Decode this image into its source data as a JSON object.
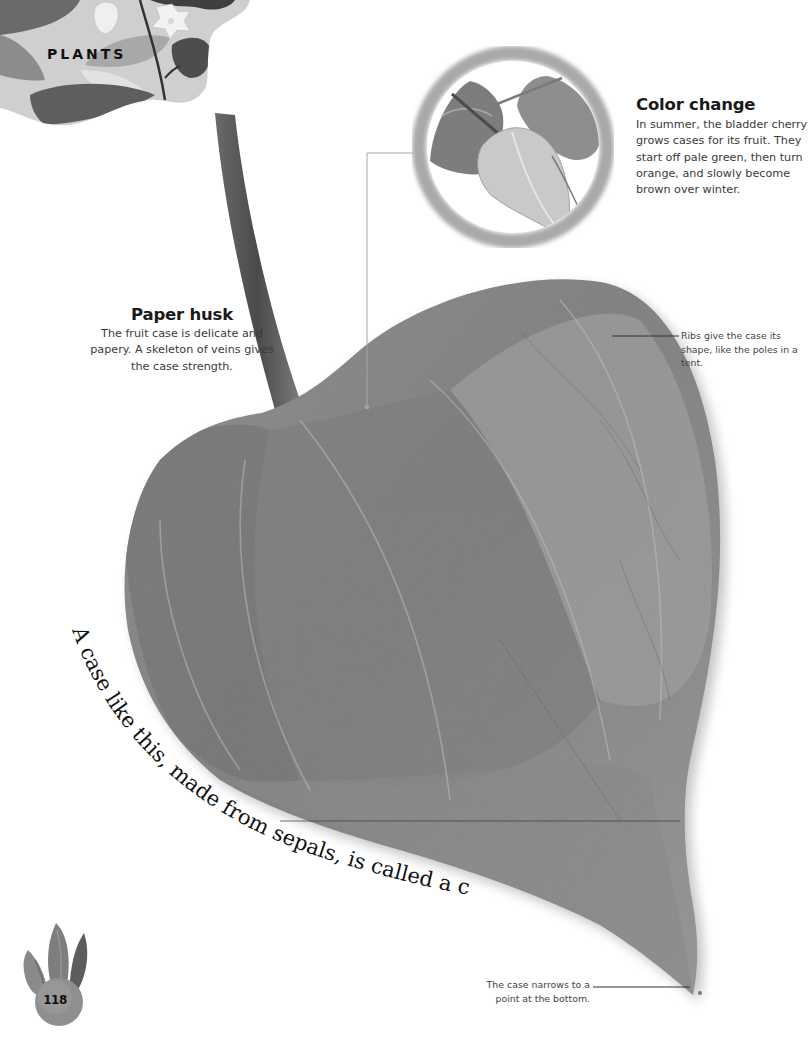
{
  "page": {
    "section_label": "PLANTS",
    "page_number": "118"
  },
  "color_change": {
    "heading": "Color change",
    "body": "In summer, the bladder cherry grows cases for its fruit. They start off pale green, then turn orange, and slowly become brown over winter."
  },
  "paper_husk": {
    "heading": "Paper husk",
    "body": "The fruit case is delicate and papery. A skeleton of veins gives the case strength."
  },
  "annotations": {
    "ribs": "Ribs give the case its shape, like the poles in a tent.",
    "narrow_point": "The case narrows to a point at the bottom."
  },
  "calyx_caption": "A case like this, made from sepals, is called a calyx.",
  "images": {
    "main": "bladder-cherry-fruit-case",
    "inset": "three-bladder-cherry-cases-in-circle",
    "header": "illustrated-leaves-and-star-flowers",
    "page_badge": "illustrated-flame-leaves-with-ball"
  },
  "colors": {
    "case_gray": "#8a8a8a",
    "case_dark": "#6b6b6b",
    "leader_line": "#9a9a9a",
    "inset_ring": "#a7a7a7"
  }
}
